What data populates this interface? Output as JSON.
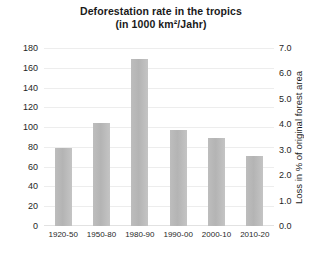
{
  "chart_data": {
    "type": "bar",
    "title": "Deforestation rate in the tropics",
    "subtitle": "(in 1000 km²/Jahr)",
    "categories": [
      "1920-50",
      "1950-80",
      "1980-90",
      "1990-00",
      "2000-10",
      "2010-20"
    ],
    "values": [
      79,
      104,
      169,
      97,
      89,
      71
    ],
    "xlabel": "",
    "ylabel": "",
    "ylim": [
      0,
      180
    ],
    "yticks": [
      "0",
      "20",
      "40",
      "60",
      "80",
      "100",
      "120",
      "140",
      "160",
      "180"
    ],
    "y2label": "Loss in % of original forest area",
    "y2lim": [
      0,
      7
    ],
    "y2ticks": [
      "0.0",
      "1.0",
      "2.0",
      "3.0",
      "4.0",
      "5.0",
      "6.0",
      "7.0"
    ],
    "grid": true,
    "legend": "none",
    "series": [
      {
        "name": "Deforestation rate",
        "values": [
          79,
          104,
          169,
          97,
          89,
          71
        ],
        "color": "#b8b8b8"
      }
    ]
  },
  "colors": {
    "bar": "#b8b8b8",
    "grid": "#ededed",
    "text": "#1f1f1f",
    "background": "#ffffff"
  }
}
